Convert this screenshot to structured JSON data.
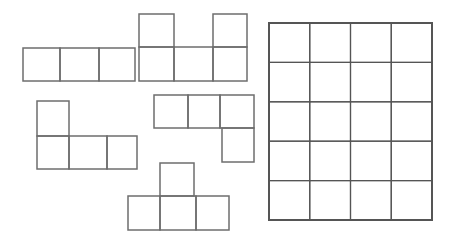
{
  "canvas": {
    "width": 454,
    "height": 241,
    "background": "#ffffff"
  },
  "colors": {
    "stroke": "#6e6e6e",
    "grid_stroke": "#555555"
  },
  "pieces": [
    {
      "name": "i-tromino-row",
      "cells": [
        [
          23,
          48,
          37,
          33
        ],
        [
          60,
          48,
          39,
          33
        ],
        [
          99,
          48,
          36,
          33
        ]
      ]
    },
    {
      "name": "u-pentomino",
      "cells": [
        [
          139,
          14,
          35,
          33
        ],
        [
          213,
          14,
          34,
          33
        ],
        [
          139,
          47,
          35,
          34
        ],
        [
          174,
          47,
          39,
          34
        ],
        [
          213,
          47,
          34,
          34
        ]
      ]
    },
    {
      "name": "l-tetromino",
      "cells": [
        [
          37,
          101,
          32,
          35
        ],
        [
          37,
          136,
          32,
          33
        ],
        [
          69,
          136,
          38,
          33
        ],
        [
          107,
          136,
          30,
          33
        ]
      ]
    },
    {
      "name": "j-tetromino",
      "cells": [
        [
          154,
          95,
          34,
          33
        ],
        [
          188,
          95,
          32,
          33
        ],
        [
          220,
          95,
          34,
          33
        ],
        [
          222,
          128,
          32,
          34
        ]
      ]
    },
    {
      "name": "t-tetromino",
      "cells": [
        [
          160,
          163,
          34,
          33
        ],
        [
          128,
          196,
          32,
          34
        ],
        [
          160,
          196,
          36,
          34
        ],
        [
          196,
          196,
          33,
          34
        ]
      ]
    }
  ],
  "grid": {
    "x": 269,
    "y": 23,
    "width": 163,
    "height": 197,
    "columns": 4,
    "rows": 5
  }
}
